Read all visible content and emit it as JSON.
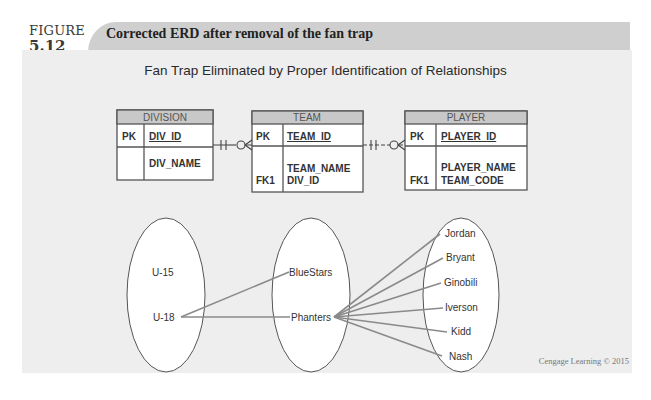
{
  "figure": {
    "label": "FIGURE",
    "number": "5.12",
    "title": "Corrected ERD after removal of the fan trap"
  },
  "diagram": {
    "title": "Fan Trap Eliminated by Proper Identification of Relationships",
    "entities": {
      "division": {
        "name": "DIVISION",
        "pk_label": "PK",
        "pk_field": "DIV_ID",
        "attributes": [
          "DIV_NAME"
        ],
        "fk_label": ""
      },
      "team": {
        "name": "TEAM",
        "pk_label": "PK",
        "pk_field": "TEAM_ID",
        "attributes": [
          "TEAM_NAME",
          "DIV_ID"
        ],
        "fk_label": "FK1"
      },
      "player": {
        "name": "PLAYER",
        "pk_label": "PK",
        "pk_field": "PLAYER_ID",
        "attributes": [
          "PLAYER_NAME",
          "TEAM_CODE"
        ],
        "fk_label": "FK1"
      }
    },
    "relationships": [
      {
        "from": "DIVISION",
        "to": "TEAM",
        "notation": "-H-O<"
      },
      {
        "from": "TEAM",
        "to": "PLAYER",
        "notation": "-H--O<"
      }
    ],
    "sets": {
      "divisions": [
        "U-15",
        "U-18"
      ],
      "teams": [
        "BlueStars",
        "Phanters"
      ],
      "players": [
        "Jordan",
        "Bryant",
        "Ginobili",
        "Iverson",
        "Kidd",
        "Nash"
      ]
    },
    "mappings": [
      {
        "from": "U-18",
        "to": "BlueStars"
      },
      {
        "from": "U-18",
        "to": "Phanters"
      },
      {
        "from": "Phanters",
        "to": "Jordan"
      },
      {
        "from": "Phanters",
        "to": "Bryant"
      },
      {
        "from": "Phanters",
        "to": "Ginobili"
      },
      {
        "from": "Phanters",
        "to": "Iverson"
      },
      {
        "from": "Phanters",
        "to": "Kidd"
      },
      {
        "from": "Phanters",
        "to": "Nash"
      }
    ]
  },
  "credit": "Cengage Learning © 2015",
  "colors": {
    "banner": "#cfcfcf",
    "panel": "#eeeeee",
    "entity_header": "#c8c8c8",
    "entity_border": "#555555",
    "link_line": "#8a8a8a"
  }
}
